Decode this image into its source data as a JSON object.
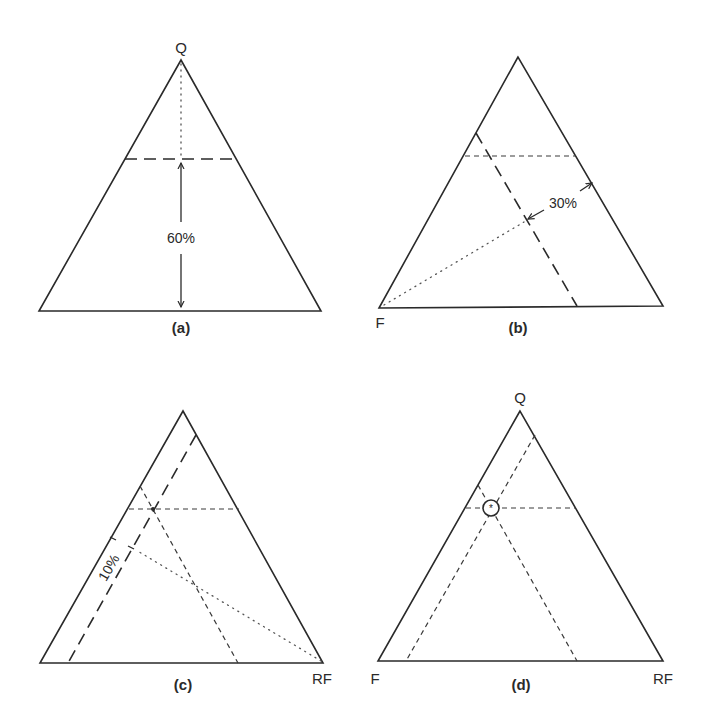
{
  "figure": {
    "panels": [
      {
        "id": "a",
        "caption": "(a)",
        "vertex_labels": {
          "top": "Q",
          "left": "",
          "right": ""
        },
        "annotation": "60%",
        "description": "Horizontal dashed line drawn at 60% height from base toward Q"
      },
      {
        "id": "b",
        "caption": "(b)",
        "vertex_labels": {
          "top": "",
          "left": "F",
          "right": ""
        },
        "annotation": "30%",
        "description": "Line parallel to right edge at 30% distance from F"
      },
      {
        "id": "c",
        "caption": "(c)",
        "vertex_labels": {
          "top": "",
          "left": "",
          "right": "RF"
        },
        "annotation": "10%",
        "description": "Line parallel to left edge at 10% distance from RF"
      },
      {
        "id": "d",
        "caption": "(d)",
        "vertex_labels": {
          "top": "Q",
          "left": "F",
          "right": "RF"
        },
        "annotation": "",
        "description": "Intersection of three lines circled as plotted point"
      }
    ],
    "composition_point": {
      "Q": 60,
      "F": 30,
      "RF": 10
    }
  }
}
